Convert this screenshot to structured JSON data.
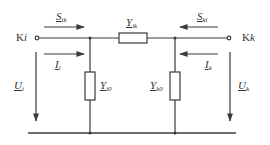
{
  "diagram": {
    "type": "pi-equivalent circuit",
    "colors": {
      "line": "#3a3a3a",
      "background": "#ffffff",
      "text": "#333333"
    },
    "terminals": {
      "left": {
        "prefix": "K",
        "index": "i"
      },
      "right": {
        "prefix": "K",
        "index": "k"
      }
    },
    "power_flows": {
      "left": {
        "symbol": "S",
        "sub": "ik",
        "direction": "right"
      },
      "right": {
        "symbol": "S",
        "sub": "ki",
        "direction": "left"
      }
    },
    "currents": {
      "left": {
        "symbol": "I",
        "sub": "i",
        "direction": "right"
      },
      "right": {
        "symbol": "I",
        "sub": "k",
        "direction": "left"
      }
    },
    "voltages": {
      "left": {
        "symbol": "U",
        "sub": "i",
        "direction": "down"
      },
      "right": {
        "symbol": "U",
        "sub": "k",
        "direction": "down"
      }
    },
    "admittances": {
      "series": {
        "symbol": "Y",
        "sub": "ik"
      },
      "shunt_left": {
        "symbol": "Y",
        "sub": "i0"
      },
      "shunt_right": {
        "symbol": "Y",
        "sub": "k0"
      }
    }
  }
}
